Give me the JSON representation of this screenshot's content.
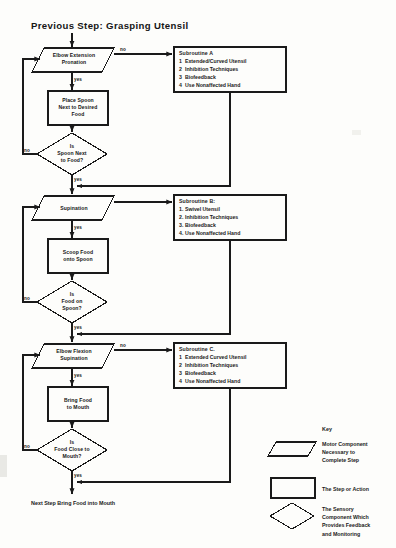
{
  "document": {
    "previous_step": "Previous Step: Grasping Utensil",
    "next_step": "Next Step  Bring Food into Mouth"
  },
  "flow": {
    "stages": [
      {
        "motor": "Elbow Extension\nPronation",
        "motor_line1": "Elbow Extension",
        "motor_line2": "Pronation",
        "action_line1": "Place Spoon",
        "action_line2": "Next to Desired",
        "action_line3": "Food",
        "sensory_line1": "Is",
        "sensory_line2": "Spoon Next",
        "sensory_line3": "to Food?",
        "yes_label": "yes",
        "no_label": "no",
        "loop_label": "no"
      },
      {
        "motor_line1": "Supination",
        "motor_line2": "",
        "action_line1": "Scoop Food",
        "action_line2": "onto Spoon",
        "action_line3": "",
        "sensory_line1": "Is",
        "sensory_line2": "Food on",
        "sensory_line3": "Spoon?",
        "yes_label": "yes",
        "no_label": "no",
        "loop_label": "no"
      },
      {
        "motor_line1": "Elbow Flexion",
        "motor_line2": "Supination",
        "action_line1": "Bring Food",
        "action_line2": "to Mouth",
        "action_line3": "",
        "sensory_line1": "Is",
        "sensory_line2": "Food Close to",
        "sensory_line3": "Mouth?",
        "yes_label": "yes",
        "no_label": "no",
        "loop_label": "no"
      }
    ]
  },
  "subroutines": [
    {
      "header": "Subroutine A",
      "items": [
        {
          "num": "1",
          "text": "Extended/Curved Utensil"
        },
        {
          "num": "2",
          "text": "Inhibition Techniques"
        },
        {
          "num": "3",
          "text": "Biofeedback"
        },
        {
          "num": "4",
          "text": "Use Nonaffected Hand"
        }
      ]
    },
    {
      "header": "Subroutine B:",
      "items": [
        {
          "num": "1.",
          "text": "Swivel Utensil"
        },
        {
          "num": "2.",
          "text": "Inhibition Techniques"
        },
        {
          "num": "3.",
          "text": "Biofeedback"
        },
        {
          "num": "4.",
          "text": "Use Nonaffected Hand"
        }
      ]
    },
    {
      "header": "Subroutine C.",
      "items": [
        {
          "num": "1",
          "text": "Extended Curved Utensil"
        },
        {
          "num": "2",
          "text": "Inhibition Techniques"
        },
        {
          "num": "3",
          "text": "Biofeedback"
        },
        {
          "num": "4",
          "text": "Use Nonaffected Hand"
        }
      ]
    }
  ],
  "key": {
    "title": "Key",
    "entries": [
      {
        "shape": "parallelogram",
        "line1": "Motor Component",
        "line2": "Necessary to",
        "line3": "Complete Step"
      },
      {
        "shape": "rectangle",
        "line1": "The Step or Action",
        "line2": "",
        "line3": ""
      },
      {
        "shape": "diamond",
        "line1": "The Sensory",
        "line2": "Component Which",
        "line3": "Provides Feedback",
        "line4": "and Monitoring"
      }
    ]
  },
  "style": {
    "ink": "#1a1a1a",
    "paper": "#fdfdfb"
  }
}
